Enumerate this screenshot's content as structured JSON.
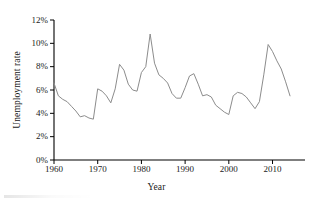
{
  "chart_data": {
    "type": "line",
    "title": "",
    "xlabel": "Year",
    "ylabel": "Unemployment rate",
    "xlim": [
      1960,
      2014
    ],
    "ylim": [
      0,
      12
    ],
    "grid": false,
    "legend": null,
    "line_color": "#8c8c8c",
    "axis_color": "#000000",
    "xticks": [
      1960,
      1970,
      1980,
      1990,
      2000,
      2010
    ],
    "xtick_labels": [
      "1960",
      "1970",
      "1980",
      "1990",
      "2000",
      "2010"
    ],
    "yticks": [
      0,
      2,
      4,
      6,
      8,
      10,
      12
    ],
    "ytick_labels": [
      "0%",
      "2%",
      "4%",
      "6%",
      "8%",
      "10%",
      "12%"
    ],
    "series": [
      {
        "name": "Unemployment rate",
        "x": [
          1960,
          1961,
          1962,
          1963,
          1964,
          1965,
          1966,
          1967,
          1968,
          1969,
          1970,
          1971,
          1972,
          1973,
          1974,
          1975,
          1976,
          1977,
          1978,
          1979,
          1980,
          1981,
          1982,
          1983,
          1984,
          1985,
          1986,
          1987,
          1988,
          1989,
          1990,
          1991,
          1992,
          1993,
          1994,
          1995,
          1996,
          1997,
          1998,
          1999,
          2000,
          2001,
          2002,
          2003,
          2004,
          2005,
          2006,
          2007,
          2008,
          2009,
          2010,
          2011,
          2012,
          2013,
          2014
        ],
        "values": [
          6.6,
          5.5,
          5.2,
          5.0,
          4.6,
          4.2,
          3.7,
          3.8,
          3.6,
          3.5,
          6.1,
          5.9,
          5.5,
          4.9,
          6.1,
          8.2,
          7.7,
          6.5,
          6.0,
          5.9,
          7.5,
          8.0,
          10.8,
          8.3,
          7.3,
          7.0,
          6.6,
          5.7,
          5.3,
          5.3,
          6.2,
          7.2,
          7.4,
          6.5,
          5.5,
          5.6,
          5.4,
          4.7,
          4.4,
          4.1,
          3.9,
          5.5,
          5.8,
          5.7,
          5.4,
          4.9,
          4.4,
          5.0,
          7.3,
          9.9,
          9.3,
          8.5,
          7.8,
          6.7,
          5.5
        ],
        "color": "#8c8c8c"
      }
    ],
    "annotations": [],
    "notable_points": [
      {
        "year": 1969,
        "value": 3.5,
        "note": "trough"
      },
      {
        "year": 1975,
        "value": 8.2,
        "note": "peak"
      },
      {
        "year": 1982,
        "value": 10.8,
        "note": "peak"
      },
      {
        "year": 1992,
        "value": 7.4,
        "note": "peak"
      },
      {
        "year": 2000,
        "value": 3.9,
        "note": "trough"
      },
      {
        "year": 2009,
        "value": 9.9,
        "note": "peak"
      }
    ]
  }
}
